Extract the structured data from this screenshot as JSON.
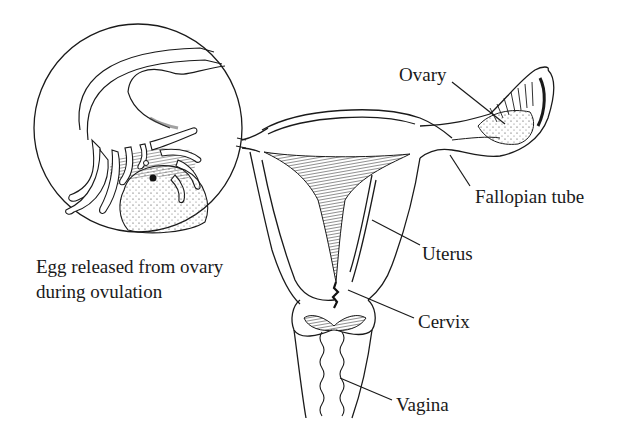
{
  "diagram": {
    "type": "anatomical-illustration",
    "inset": {
      "caption_line1": "Egg released from ovary",
      "caption_line2": "during ovulation"
    },
    "labels": {
      "ovary": "Ovary",
      "fallopian_tube": "Fallopian tube",
      "uterus": "Uterus",
      "cervix": "Cervix",
      "vagina": "Vagina"
    },
    "colors": {
      "ink": "#1a1a1a",
      "background": "#ffffff"
    }
  }
}
